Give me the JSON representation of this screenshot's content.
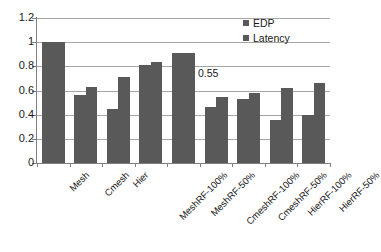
{
  "chart_data": {
    "type": "bar",
    "title": "",
    "subtitle": "",
    "xlabel": "",
    "ylabel": "",
    "ylim": [
      0,
      1.2
    ],
    "ytick_labels": [
      "0",
      "0.2",
      "0.4",
      "0.6",
      "0.8",
      "1",
      "1.2"
    ],
    "ytick_values": [
      0,
      0.2,
      0.4,
      0.6,
      0.8,
      1,
      1.2
    ],
    "grid": true,
    "grid_axis": "y",
    "legend_position": "top-right",
    "categories": [
      "Mesh",
      "Cmesh",
      "Hier",
      "MeshRF-100%",
      "MeshRF-50%",
      "CmeshRF-100%",
      "CmeshRF-50%",
      "HierRF-100%",
      "HierRF-50%"
    ],
    "series": [
      {
        "name": "EDP",
        "color": "#595959",
        "values": [
          1.0,
          0.56,
          0.45,
          0.81,
          0.91,
          0.46,
          0.53,
          0.36,
          0.4
        ]
      },
      {
        "name": "Latency",
        "color": "#595959",
        "values": [
          1.0,
          0.63,
          0.71,
          0.84,
          0.91,
          0.55,
          0.58,
          0.62,
          0.66
        ]
      }
    ],
    "annotations": [
      {
        "text": "0.55",
        "category": "CmeshRF-100%",
        "series": "Latency",
        "value": 0.55
      }
    ]
  },
  "legend": {
    "items": [
      {
        "label": "EDP",
        "color": "#595959"
      },
      {
        "label": "Latency",
        "color": "#595959"
      }
    ]
  },
  "colors": {
    "bar": "#595959",
    "gridline": "#a6a6a6",
    "axis": "#808080",
    "text": "#1a1a1a",
    "background": "#ffffff"
  }
}
